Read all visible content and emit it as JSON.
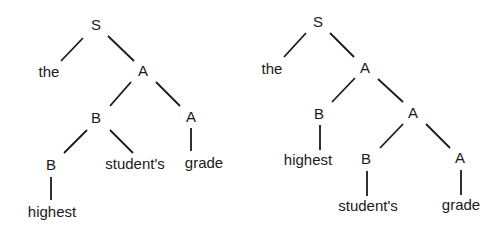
{
  "trees": [
    {
      "id": "left-tree",
      "nodes": [
        {
          "label": "S",
          "x": 96,
          "y": 24
        },
        {
          "label": "the",
          "x": 49,
          "y": 71
        },
        {
          "label": "A",
          "x": 143,
          "y": 70
        },
        {
          "label": "B",
          "x": 96,
          "y": 117
        },
        {
          "label": "A",
          "x": 191,
          "y": 116
        },
        {
          "label": "B",
          "x": 51,
          "y": 164
        },
        {
          "label": "student's",
          "x": 135,
          "y": 163
        },
        {
          "label": "grade",
          "x": 204,
          "y": 162
        },
        {
          "label": "highest",
          "x": 52,
          "y": 211
        }
      ],
      "edges": [
        [
          83,
          38,
          61,
          61
        ],
        [
          108,
          36,
          134,
          61
        ],
        [
          131,
          82,
          110,
          106
        ],
        [
          156,
          82,
          180,
          106
        ],
        [
          87,
          130,
          64,
          153
        ],
        [
          110,
          130,
          133,
          153
        ],
        [
          191,
          128,
          191,
          151
        ],
        [
          51,
          177,
          51,
          200
        ]
      ]
    },
    {
      "id": "right-tree",
      "nodes": [
        {
          "label": "S",
          "x": 318,
          "y": 21
        },
        {
          "label": "the",
          "x": 272,
          "y": 68
        },
        {
          "label": "A",
          "x": 365,
          "y": 67
        },
        {
          "label": "B",
          "x": 319,
          "y": 113
        },
        {
          "label": "A",
          "x": 413,
          "y": 112
        },
        {
          "label": "highest",
          "x": 308,
          "y": 159
        },
        {
          "label": "B",
          "x": 366,
          "y": 158
        },
        {
          "label": "A",
          "x": 460,
          "y": 157
        },
        {
          "label": "student's",
          "x": 368,
          "y": 205
        },
        {
          "label": "grade",
          "x": 461,
          "y": 204
        }
      ],
      "edges": [
        [
          306,
          33,
          284,
          57
        ],
        [
          330,
          33,
          354,
          57
        ],
        [
          355,
          78,
          332,
          102
        ],
        [
          378,
          79,
          403,
          102
        ],
        [
          320,
          125,
          320,
          150
        ],
        [
          403,
          124,
          380,
          148
        ],
        [
          426,
          124,
          450,
          148
        ],
        [
          367,
          171,
          367,
          196
        ],
        [
          461,
          170,
          461,
          195
        ]
      ]
    }
  ]
}
